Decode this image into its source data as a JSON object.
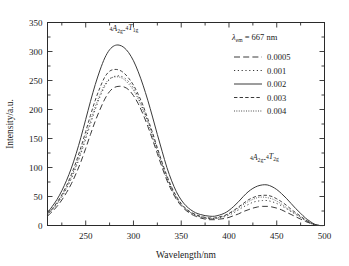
{
  "chart_data": {
    "type": "line",
    "title": "",
    "subtitle": "",
    "xlabel": "Wavelength/nm",
    "ylabel": "Intensity/a.u.",
    "xlim": [
      210,
      500
    ],
    "ylim": [
      0,
      350
    ],
    "xticks": [
      250,
      300,
      350,
      400,
      450,
      500
    ],
    "xtick_labels": [
      "250",
      "300",
      "350",
      "400",
      "450",
      "500"
    ],
    "yticks": [
      0,
      50,
      100,
      150,
      200,
      250,
      300,
      350
    ],
    "ytick_labels": [
      "0",
      "50",
      "100",
      "150",
      "200",
      "250",
      "300",
      "350"
    ],
    "x_minor_step": 25,
    "y_minor_step": 25,
    "grid": false,
    "legend_position": "top-right",
    "legend_title": "λₑₘ = 667 nm",
    "legend_title_parts": {
      "lambda": "λ",
      "subscript": "em",
      "value": "= 667 nm"
    },
    "annotations": [
      {
        "id": "peak1-assignment",
        "text": "⁴A₂g-⁴T₁g",
        "parts": {
          "sup1": "4",
          "base1": "A",
          "sub1": "2g",
          "dash": "-",
          "sup2": "4",
          "base2": "T",
          "sub2": "1g"
        },
        "x": 290,
        "y": 330
      },
      {
        "id": "peak2-assignment",
        "text": "⁴A₂g-⁴T₂g",
        "parts": {
          "sup1": "4",
          "base1": "A",
          "sub1": "2g",
          "dash": "-",
          "sup2": "4",
          "base2": "T",
          "sub2": "2g"
        },
        "x": 437,
        "y": 108
      }
    ],
    "x": [
      210,
      215,
      220,
      225,
      230,
      235,
      240,
      245,
      250,
      255,
      260,
      265,
      270,
      275,
      280,
      285,
      290,
      295,
      300,
      305,
      310,
      315,
      320,
      325,
      330,
      335,
      340,
      345,
      350,
      355,
      360,
      365,
      370,
      375,
      380,
      385,
      390,
      395,
      400,
      405,
      410,
      415,
      420,
      425,
      430,
      435,
      440,
      445,
      450,
      455,
      460,
      465,
      470,
      475,
      480,
      485,
      490,
      495,
      500
    ],
    "series": [
      {
        "name": "0.0005",
        "label": "0.0005",
        "linestyle": "long-dash",
        "values": [
          16,
          24,
          33,
          44,
          57,
          72,
          90,
          110,
          133,
          157,
          180,
          200,
          218,
          231,
          238,
          240,
          239,
          234,
          224,
          210,
          192,
          171,
          148,
          124,
          100,
          78,
          60,
          45,
          34,
          26,
          20,
          16,
          13,
          11,
          10,
          10,
          11,
          12,
          14,
          17,
          20,
          24,
          27,
          30,
          32,
          33,
          33,
          32,
          30,
          27,
          23,
          19,
          15,
          11,
          7,
          4,
          1,
          0,
          0
        ]
      },
      {
        "name": "0.001",
        "label": "0.001",
        "linestyle": "sparse-dot",
        "values": [
          18,
          27,
          37,
          49,
          64,
          81,
          101,
          124,
          149,
          175,
          200,
          222,
          240,
          252,
          257,
          258,
          255,
          248,
          237,
          221,
          202,
          180,
          156,
          131,
          106,
          83,
          64,
          48,
          36,
          28,
          22,
          18,
          15,
          13,
          12,
          12,
          13,
          15,
          18,
          22,
          27,
          32,
          36,
          40,
          42,
          43,
          43,
          41,
          38,
          34,
          29,
          24,
          19,
          14,
          9,
          5,
          1,
          0,
          0
        ]
      },
      {
        "name": "0.002",
        "label": "0.002",
        "linestyle": "solid",
        "values": [
          22,
          33,
          45,
          60,
          78,
          99,
          124,
          152,
          183,
          214,
          243,
          268,
          289,
          303,
          310,
          311,
          307,
          298,
          284,
          265,
          242,
          216,
          187,
          157,
          128,
          100,
          77,
          58,
          44,
          34,
          27,
          22,
          19,
          17,
          16,
          16,
          18,
          21,
          26,
          33,
          41,
          50,
          58,
          64,
          68,
          70,
          70,
          67,
          62,
          55,
          47,
          38,
          29,
          21,
          13,
          7,
          2,
          0,
          0
        ]
      },
      {
        "name": "0.003",
        "label": "0.003",
        "linestyle": "short-dash",
        "values": [
          20,
          29,
          40,
          53,
          69,
          88,
          110,
          135,
          162,
          190,
          216,
          238,
          256,
          266,
          269,
          268,
          263,
          254,
          242,
          226,
          207,
          184,
          160,
          134,
          109,
          86,
          66,
          50,
          38,
          29,
          23,
          19,
          16,
          14,
          13,
          13,
          15,
          17,
          21,
          26,
          32,
          38,
          44,
          48,
          51,
          52,
          52,
          50,
          46,
          41,
          35,
          28,
          22,
          16,
          10,
          5,
          1,
          0,
          0
        ]
      },
      {
        "name": "0.004",
        "label": "0.004",
        "linestyle": "fine-dot",
        "values": [
          19,
          28,
          38,
          51,
          66,
          84,
          105,
          128,
          154,
          180,
          205,
          226,
          243,
          253,
          256,
          256,
          252,
          244,
          233,
          218,
          199,
          178,
          154,
          129,
          105,
          82,
          63,
          47,
          36,
          28,
          22,
          18,
          15,
          13,
          12,
          12,
          14,
          16,
          20,
          25,
          30,
          36,
          41,
          45,
          48,
          49,
          48,
          46,
          42,
          37,
          31,
          25,
          20,
          14,
          9,
          4,
          1,
          0,
          0
        ]
      }
    ]
  }
}
